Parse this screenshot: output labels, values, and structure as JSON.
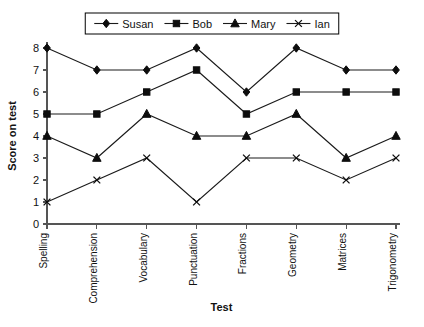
{
  "chart_data": {
    "type": "line",
    "title": "",
    "xlabel": "Test",
    "ylabel": "Score on test",
    "categories": [
      "Spelling",
      "Comprehension",
      "Vocabulary",
      "Punctuation",
      "Fractions",
      "Geometry",
      "Matrices",
      "Trigonometry"
    ],
    "ylim": [
      0,
      8
    ],
    "yticks": [
      "0",
      "1",
      "2",
      "3",
      "4",
      "5",
      "6",
      "7",
      "8"
    ],
    "grid": false,
    "legend_position": "top-center",
    "series": [
      {
        "name": "Susan",
        "marker": "diamond",
        "color": "#0d0d0d",
        "values": [
          8,
          7,
          7,
          8,
          6,
          8,
          7,
          7
        ]
      },
      {
        "name": "Bob",
        "marker": "square",
        "color": "#0d0d0d",
        "values": [
          5,
          5,
          6,
          7,
          5,
          6,
          6,
          6
        ]
      },
      {
        "name": "Mary",
        "marker": "triangle",
        "color": "#0d0d0d",
        "values": [
          4,
          3,
          5,
          4,
          4,
          5,
          3,
          4
        ]
      },
      {
        "name": "Ian",
        "marker": "x",
        "color": "#0d0d0d",
        "values": [
          1,
          2,
          3,
          1,
          3,
          3,
          2,
          3
        ]
      }
    ]
  }
}
